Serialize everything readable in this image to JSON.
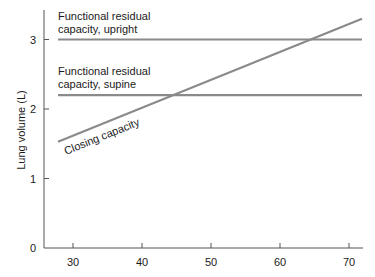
{
  "chart_data": {
    "type": "line",
    "title": "",
    "xlabel": "",
    "ylabel": "Lung volume (L)",
    "xlim": [
      27,
      73
    ],
    "ylim": [
      0,
      3.4
    ],
    "x_ticks": [
      30,
      40,
      50,
      60,
      70
    ],
    "y_ticks": [
      0,
      1,
      2,
      3
    ],
    "x_tick_labels": [
      "30",
      "40",
      "50",
      "60",
      "70"
    ],
    "y_tick_labels": [
      "0",
      "1",
      "2",
      "3"
    ],
    "grid": false,
    "legend": "none (inline annotations)",
    "series": [
      {
        "name": "Functional residual capacity, upright",
        "label_lines": [
          "Functional residual",
          "capacity, upright"
        ],
        "x": [
          28,
          73
        ],
        "y": [
          3.0,
          3.0
        ],
        "color": "#8a8a8a"
      },
      {
        "name": "Functional residual capacity, supine",
        "label_lines": [
          "Functional residual",
          "capacity, supine"
        ],
        "x": [
          28,
          73
        ],
        "y": [
          2.2,
          2.2
        ],
        "color": "#8a8a8a"
      },
      {
        "name": "Closing capacity",
        "label_lines": [
          "Closing capacity"
        ],
        "x": [
          28,
          73
        ],
        "y": [
          1.53,
          3.3
        ],
        "color": "#8a8a8a"
      }
    ],
    "annotations": [
      "Closing capacity intersects supine FRC at age ~45",
      "Closing capacity intersects upright FRC at age ~65"
    ]
  }
}
